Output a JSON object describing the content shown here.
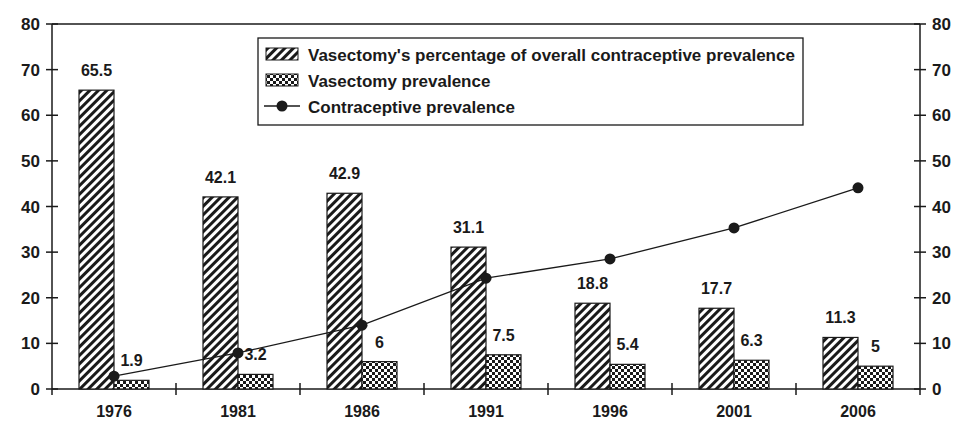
{
  "chart_data": {
    "type": "bar",
    "title": "",
    "xlabel": "",
    "ylabel": "",
    "ylim": [
      0,
      80
    ],
    "y_ticks": [
      0,
      10,
      20,
      30,
      40,
      50,
      60,
      70,
      80
    ],
    "y2lim": [
      0,
      80
    ],
    "y2_ticks": [
      0,
      10,
      20,
      30,
      40,
      50,
      60,
      70,
      80
    ],
    "grid": false,
    "legend_position": "top-center (boxed)",
    "categories": [
      "1976",
      "1981",
      "1986",
      "1991",
      "1996",
      "2001",
      "2006"
    ],
    "series": [
      {
        "name": "Vasectomy's percentage of overall contraceptive prevalence",
        "type": "bar",
        "pattern": "diagonal-hatch",
        "values": [
          65.5,
          42.1,
          42.9,
          31.1,
          18.8,
          17.7,
          11.3
        ],
        "labels": [
          "65.5",
          "42.1",
          "42.9",
          "31.1",
          "18.8",
          "17.7",
          "11.3"
        ]
      },
      {
        "name": "Vasectomy prevalence",
        "type": "bar",
        "pattern": "checkerboard",
        "values": [
          1.9,
          3.2,
          6,
          7.5,
          5.4,
          6.3,
          5
        ],
        "labels": [
          "1.9",
          "3.2",
          "6",
          "7.5",
          "5.4",
          "6.3",
          "5"
        ]
      },
      {
        "name": "Contraceptive prevalence",
        "type": "line",
        "marker": "filled-circle",
        "values": [
          2.8,
          7.9,
          14.0,
          24.3,
          28.5,
          35.3,
          44.1
        ]
      }
    ]
  },
  "colors": {
    "ink": "#1a1a1a",
    "background": "#ffffff"
  }
}
